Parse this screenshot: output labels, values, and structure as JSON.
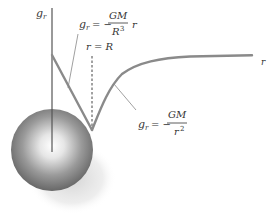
{
  "diagram": {
    "axes": {
      "y_label": "g",
      "y_label_sub": "r",
      "x_label": "r"
    },
    "marker": {
      "label": "r = R"
    },
    "formula_inside": {
      "lhs": "g",
      "lhs_sub": "r",
      "eq": "= −",
      "numerator": "GM",
      "denominator": "R",
      "denominator_sup": "3",
      "trailing": "r"
    },
    "formula_outside": {
      "lhs": "g",
      "lhs_sub": "r",
      "eq": "= −",
      "numerator": "GM",
      "denominator": "r",
      "denominator_sup": "2"
    },
    "colors": {
      "axis": "#555555",
      "curve": "#8a8a8a",
      "leader": "#888888",
      "text": "#333333"
    }
  }
}
